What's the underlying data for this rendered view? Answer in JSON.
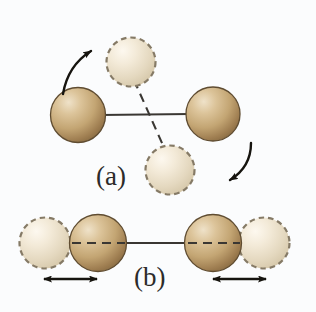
{
  "figure": {
    "background_color": "#fbfcfd",
    "panels": [
      {
        "id": "a",
        "label": "(a)",
        "name": "rotation",
        "description": "Diatomic molecule rotating about its center of mass"
      },
      {
        "id": "b",
        "label": "(b)",
        "name": "vibration",
        "description": "Diatomic molecule vibrating along the bond axis"
      }
    ],
    "colors": {
      "atom_solid_light": "#e7d9bd",
      "atom_solid_mid": "#c3a573",
      "atom_solid_dark": "#8d6f45",
      "atom_solid_outline": "#5f4c31",
      "atom_ghost_light": "#faf3e6",
      "atom_ghost_mid": "#e7dcc6",
      "atom_ghost_dark": "#cfc0a2",
      "atom_ghost_outline": "#857a66",
      "bond_line": "#3a3733",
      "dashed_line": "#3a3733",
      "arrow": "#16140f",
      "label_text": "#2c2b2a"
    },
    "panel_a": {
      "solid_atoms": [
        {
          "name": "atom-left",
          "cx": 78,
          "cy": 115,
          "r": 28
        },
        {
          "name": "atom-right",
          "cx": 213,
          "cy": 114,
          "r": 27
        }
      ],
      "ghost_atoms": [
        {
          "name": "ghost-atom-top",
          "cx": 131,
          "cy": 62,
          "r": 25
        },
        {
          "name": "ghost-atom-bottom",
          "cx": 170,
          "cy": 170,
          "r": 25
        }
      ],
      "bond": {
        "x1": 103,
        "y1": 115,
        "x2": 187,
        "y2": 114
      },
      "dashed_bond": {
        "x1": 137,
        "y1": 86,
        "x2": 163,
        "y2": 146
      },
      "arrows": [
        {
          "name": "rotation-arrow-left",
          "direction": "counter-clockwise-up"
        },
        {
          "name": "rotation-arrow-right",
          "direction": "clockwise-down"
        }
      ]
    },
    "panel_b": {
      "solid_atoms": [
        {
          "name": "atom-left",
          "cx": 98,
          "cy": 243,
          "r": 29
        },
        {
          "name": "atom-right",
          "cx": 213,
          "cy": 243,
          "r": 29
        }
      ],
      "ghost_atoms": [
        {
          "name": "ghost-atom-left",
          "cx": 45,
          "cy": 243,
          "r": 26
        },
        {
          "name": "ghost-atom-right",
          "cx": 264,
          "cy": 243,
          "r": 26
        }
      ],
      "bond": {
        "x1": 72,
        "y1": 243,
        "x2": 240,
        "y2": 243
      },
      "dashed_segments": [
        {
          "x1": 76,
          "y1": 243,
          "x2": 124,
          "y2": 243
        },
        {
          "x1": 188,
          "y1": 243,
          "x2": 236,
          "y2": 243
        }
      ],
      "double_arrows": [
        {
          "name": "vibration-arrow-left",
          "x1": 42,
          "y1": 279,
          "x2": 98,
          "y2": 279
        },
        {
          "name": "vibration-arrow-right",
          "x1": 212,
          "y1": 279,
          "x2": 268,
          "y2": 279
        }
      ]
    }
  }
}
